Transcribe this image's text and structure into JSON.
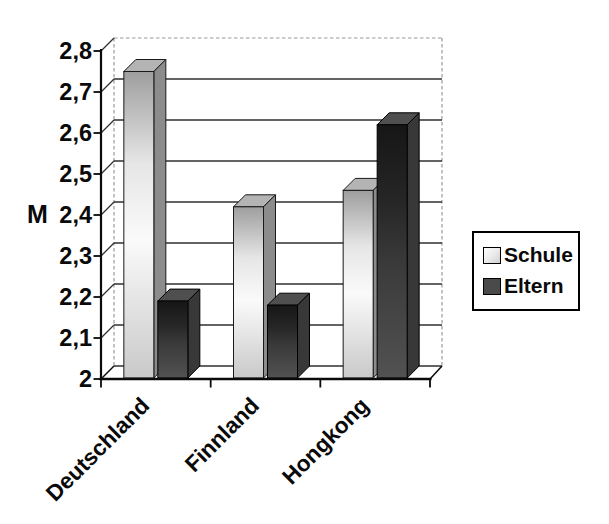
{
  "page": {
    "background": "#ffffff"
  },
  "chart_data": {
    "type": "bar",
    "style": "3d-column",
    "title": "",
    "categories": [
      "Deutschland",
      "Finnland",
      "Hongkong"
    ],
    "series": [
      {
        "name": "Schule",
        "values": [
          2.75,
          2.42,
          2.46
        ],
        "fill": {
          "front": [
            "#9e9e9e",
            "#e6e6e6",
            "#fafafa",
            "#c9c9c9"
          ],
          "side": "#8c8c8c",
          "top": "#b4b4b4",
          "stroke": "#1a1a1a"
        },
        "legend_swatch": "#e9e9e9"
      },
      {
        "name": "Eltern",
        "values": [
          2.19,
          2.18,
          2.62
        ],
        "fill": {
          "front": [
            "#161616",
            "#262626",
            "#3a3a3a",
            "#525252"
          ],
          "side": "#383838",
          "top": "#4f4f4f",
          "stroke": "#000000"
        },
        "legend_swatch": "#4a4a4a"
      }
    ],
    "xlabel": "",
    "ylabel": "M",
    "ylim": [
      2.0,
      2.8
    ],
    "ytick_step": 0.1,
    "ytick_labels": [
      "2",
      "2,1",
      "2,2",
      "2,3",
      "2,4",
      "2,5",
      "2,6",
      "2,7",
      "2,8"
    ],
    "decimal_separator": ",",
    "grid": true,
    "legend_position": "right",
    "colors": {
      "axis": "#0a0a0a",
      "gridline": "#2f2f2f",
      "wall_dash": "#9a9a9a",
      "text": "#0a0a0a"
    }
  }
}
